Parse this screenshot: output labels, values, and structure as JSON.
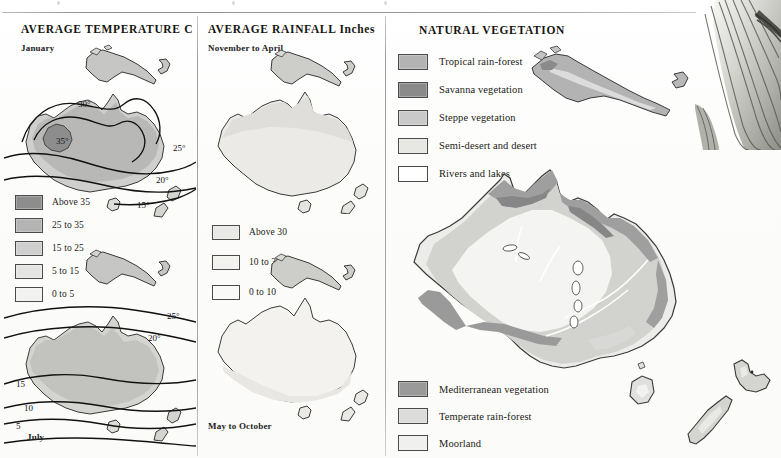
{
  "page": {
    "width": 781,
    "height": 458,
    "background": "#fdfdfc"
  },
  "columns": {
    "temperature": {
      "title": "AVERAGE TEMPERATURE  C",
      "map_top_caption": "January",
      "map_bottom_caption": "July",
      "legend": [
        {
          "label": "Above 35",
          "color": "#8d8d8d"
        },
        {
          "label": "25 to 35",
          "color": "#b4b4b4"
        },
        {
          "label": "15 to 25",
          "color": "#cfcfcf"
        },
        {
          "label": "5 to 15",
          "color": "#e4e4e2"
        },
        {
          "label": "0 to 5",
          "color": "#f2f2f0"
        }
      ],
      "january_isotherms": [
        "30°",
        "35°",
        "25°",
        "20°",
        "15°"
      ],
      "july_isotherms": [
        "25°",
        "20°",
        "15",
        "10",
        "5"
      ]
    },
    "rainfall": {
      "title": "AVERAGE RAINFALL  Inches",
      "map_top_caption": "November to April",
      "map_bottom_caption": "May to October",
      "legend": [
        {
          "label": "Above 30",
          "color": "#e9e9e6"
        },
        {
          "label": "10 to 30",
          "color": "#f2f2ef"
        },
        {
          "label": "0 to 10",
          "color": "#f9f9f7"
        }
      ]
    },
    "vegetation": {
      "title": "NATURAL VEGETATION",
      "legend_top": [
        {
          "label": "Tropical rain-forest",
          "color": "#b3b3b3"
        },
        {
          "label": "Savanna vegetation",
          "color": "#8a8a8a"
        },
        {
          "label": "Steppe vegetation",
          "color": "#c9c9c9"
        },
        {
          "label": "Semi-desert and desert",
          "color": "#e7e7e4"
        },
        {
          "label": "Rivers and lakes",
          "color": "#ffffff"
        }
      ],
      "legend_bottom": [
        {
          "label": "Mediterranean vegetation",
          "color": "#9a9a9a"
        },
        {
          "label": "Temperate rain-forest",
          "color": "#dcdcda"
        },
        {
          "label": "Moorland",
          "color": "#f0f0ee"
        }
      ]
    }
  },
  "colors": {
    "rule": "#9d9d9d",
    "outline": "#3a3a3a",
    "isotherm": "#111111",
    "text": "#1b1b15",
    "paper": "#fdfdfc"
  }
}
